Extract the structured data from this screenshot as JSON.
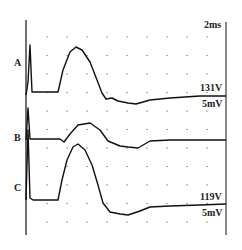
{
  "chart_data": {
    "type": "line",
    "title": "",
    "xlabel": "",
    "ylabel": "",
    "time_scale_label": "2ms",
    "grid": "dotted",
    "series": [
      {
        "name": "A",
        "amplitude_label": "131V",
        "scale_label": "5mV",
        "points": [
          [
            26,
            95
          ],
          [
            28,
            82
          ],
          [
            30,
            45
          ],
          [
            32,
            92
          ],
          [
            33,
            92
          ],
          [
            58,
            92
          ],
          [
            63,
            70
          ],
          [
            70,
            52
          ],
          [
            76,
            47
          ],
          [
            82,
            50
          ],
          [
            90,
            62
          ],
          [
            97,
            80
          ],
          [
            102,
            93
          ],
          [
            106,
            99
          ],
          [
            112,
            98
          ],
          [
            118,
            101
          ],
          [
            128,
            103
          ],
          [
            136,
            104
          ],
          [
            150,
            100
          ],
          [
            170,
            98
          ],
          [
            200,
            96
          ],
          [
            226,
            96
          ]
        ]
      },
      {
        "name": "B",
        "amplitude_label": "",
        "scale_label": "",
        "points": [
          [
            26,
            140
          ],
          [
            28,
            108
          ],
          [
            30,
            139
          ],
          [
            33,
            139
          ],
          [
            60,
            139
          ],
          [
            64,
            142
          ],
          [
            70,
            134
          ],
          [
            78,
            125
          ],
          [
            90,
            123
          ],
          [
            100,
            130
          ],
          [
            108,
            141
          ],
          [
            120,
            146
          ],
          [
            128,
            147
          ],
          [
            138,
            148
          ],
          [
            150,
            141
          ],
          [
            170,
            140
          ],
          [
            200,
            140
          ],
          [
            226,
            140
          ]
        ]
      },
      {
        "name": "C",
        "amplitude_label": "119V",
        "scale_label": "5mV",
        "points": [
          [
            26,
            200
          ],
          [
            28,
            130
          ],
          [
            30,
            198
          ],
          [
            33,
            200
          ],
          [
            58,
            200
          ],
          [
            62,
            180
          ],
          [
            67,
            160
          ],
          [
            73,
            147
          ],
          [
            78,
            144
          ],
          [
            85,
            150
          ],
          [
            92,
            165
          ],
          [
            98,
            185
          ],
          [
            103,
            203
          ],
          [
            110,
            212
          ],
          [
            120,
            214
          ],
          [
            128,
            215
          ],
          [
            140,
            211
          ],
          [
            150,
            207
          ],
          [
            170,
            206
          ],
          [
            200,
            205
          ],
          [
            226,
            204
          ]
        ]
      }
    ],
    "labels": {
      "A": "A",
      "B": "B",
      "C": "C",
      "time": "2ms",
      "A_value": "131V",
      "A_scale": "5mV",
      "C_value": "119V",
      "C_scale": "5mV"
    }
  }
}
